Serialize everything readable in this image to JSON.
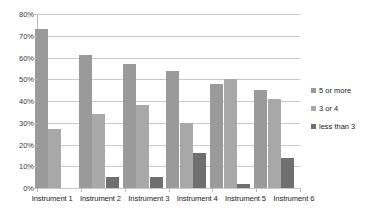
{
  "chart_data": {
    "type": "bar",
    "title": "",
    "xlabel": "",
    "ylabel": "",
    "ylim": [
      0,
      80
    ],
    "yticks": [
      "0%",
      "10%",
      "20%",
      "30%",
      "40%",
      "50%",
      "60%",
      "70%",
      "80%"
    ],
    "ytick_values": [
      0,
      10,
      20,
      30,
      40,
      50,
      60,
      70,
      80
    ],
    "grid": true,
    "legend_position": "right",
    "categories": [
      "Instrument 1",
      "Instrument 2",
      "Instrument 3",
      "Instrument 4",
      "Instrument 5",
      "Instrument 6"
    ],
    "series": [
      {
        "name": "5 or more",
        "color": "#9a9a9a",
        "values": [
          73,
          61,
          57,
          54,
          48,
          45
        ]
      },
      {
        "name": "3 or 4",
        "color": "#a8a8a8",
        "values": [
          27,
          34,
          38,
          30,
          50,
          41
        ]
      },
      {
        "name": "less than 3",
        "color": "#6f6f6f",
        "values": [
          0,
          5,
          5,
          16,
          2,
          14
        ]
      }
    ]
  },
  "legend": {
    "items": [
      {
        "label": "5 or more",
        "color": "#9a9a9a"
      },
      {
        "label": "3 or 4",
        "color": "#a8a8a8"
      },
      {
        "label": "less than 3",
        "color": "#6f6f6f"
      }
    ]
  }
}
